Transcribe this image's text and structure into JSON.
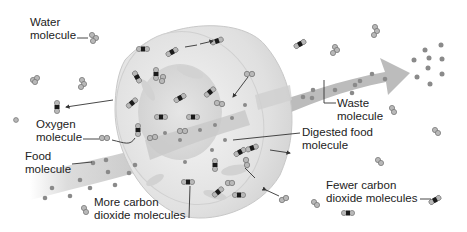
{
  "diagram": {
    "colors": {
      "background": "#ffffff",
      "cell_shell": "#dcdcdc",
      "cell_interior": "#e8e8e8",
      "arrow_band": "#bdbdbd",
      "molecule_gray": "#8a8a8a",
      "molecule_dark": "#1a1a1a",
      "label_text": "#222222"
    },
    "labels": {
      "water": "Water\nmolecule",
      "oxygen": "Oxygen\nmolecule",
      "food": "Food\nmolecule",
      "more_co2": "More carbon\ndioxide molecules",
      "digested_food": "Digested food\nmolecule",
      "waste": "Waste\nmolecule",
      "fewer_co2": "Fewer carbon\ndioxide molecules"
    }
  }
}
